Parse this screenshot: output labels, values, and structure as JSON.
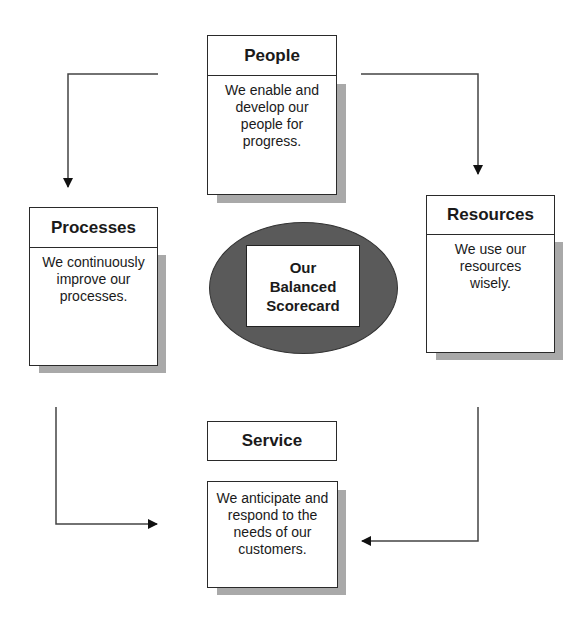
{
  "diagram": {
    "center": {
      "label_lines": [
        "Our",
        "Balanced",
        "Scorecard"
      ],
      "ellipse_color": "#5a5a5a"
    },
    "nodes": {
      "people": {
        "title": "People",
        "description": "We enable and develop our people for progress."
      },
      "processes": {
        "title": "Processes",
        "description": "We continuously improve our processes."
      },
      "resources": {
        "title": "Resources",
        "description": "We use our resources wisely."
      },
      "service": {
        "title": "Service",
        "description": "We anticipate and respond to the needs of our customers."
      }
    },
    "edges": [
      {
        "from": "people",
        "to": "processes"
      },
      {
        "from": "people",
        "to": "resources"
      },
      {
        "from": "processes",
        "to": "service"
      },
      {
        "from": "resources",
        "to": "service"
      }
    ],
    "colors": {
      "border": "#2a2a2a",
      "shadow": "#a9a9a9",
      "arrow": "#333333"
    }
  }
}
